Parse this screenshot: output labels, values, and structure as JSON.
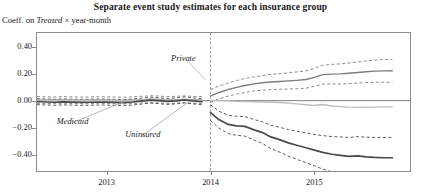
{
  "title": "Separate event study estimates for each insurance group",
  "subtitle": {
    "prefix": "Coeff. on ",
    "emphasis": "Treated",
    "suffix": " × year-month"
  },
  "series_labels": {
    "private": "Private",
    "medicaid": "Medicaid",
    "uninsured": "Uninsured"
  },
  "colors": {
    "private": "#7d7d7d",
    "medicaid": "#bdbdbd",
    "uninsured": "#4a4a4a",
    "frame": "#8c8c8c",
    "zero_line": "#6f6f6f",
    "event_line": "#8c8c8c"
  },
  "chart_data": {
    "type": "line",
    "title": "Separate event study estimates for each insurance group",
    "subtitle": "Coeff. on Treated × year-month",
    "xlabel": "",
    "ylabel": "Coeff. on Treated × year-month",
    "ylim": [
      -0.52,
      0.5
    ],
    "xlim": [
      2012.33,
      2015.92
    ],
    "yticks": [
      0.4,
      0.2,
      0.0,
      -0.2,
      -0.4
    ],
    "ytick_labels": [
      "0.40",
      "0.20",
      "0.00",
      "−0.20",
      "−0.40"
    ],
    "xticks": [
      2013.0,
      2014.0,
      2015.0
    ],
    "xtick_labels": [
      "2013",
      "2014",
      "2015"
    ],
    "grid": false,
    "legend": "inline-annotations",
    "zero_line": 0.0,
    "event_line": {
      "x": 2014.0,
      "style": "dashed",
      "label": ""
    },
    "ci_style": "dashed",
    "ci_level": "95%",
    "series": [
      {
        "name": "Private",
        "color": "#7d7d7d",
        "x": [
          2012.33,
          2012.42,
          2012.5,
          2012.58,
          2012.67,
          2012.75,
          2012.83,
          2012.92,
          2013.0,
          2013.08,
          2013.17,
          2013.25,
          2013.33,
          2013.42,
          2013.5,
          2013.58,
          2013.67,
          2013.75,
          2013.83,
          2013.92,
          2014.0,
          2014.08,
          2014.17,
          2014.25,
          2014.33,
          2014.42,
          2014.5,
          2014.58,
          2014.67,
          2014.75,
          2014.83,
          2014.92,
          2015.0,
          2015.08,
          2015.17,
          2015.25,
          2015.33,
          2015.42,
          2015.5,
          2015.58,
          2015.67,
          2015.75
        ],
        "values": [
          0.005,
          0.004,
          0.003,
          0.006,
          0.004,
          0.002,
          0.003,
          0.005,
          0.004,
          0.002,
          0.001,
          0.003,
          0.006,
          0.01,
          0.008,
          0.004,
          0.006,
          0.009,
          0.006,
          0.003,
          0.035,
          0.06,
          0.082,
          0.098,
          0.112,
          0.124,
          0.132,
          0.138,
          0.142,
          0.146,
          0.15,
          0.156,
          0.172,
          0.192,
          0.196,
          0.198,
          0.202,
          0.208,
          0.214,
          0.218,
          0.22,
          0.221
        ],
        "ci_upper": [
          0.03,
          0.028,
          0.027,
          0.03,
          0.028,
          0.026,
          0.027,
          0.029,
          0.028,
          0.026,
          0.025,
          0.028,
          0.032,
          0.036,
          0.034,
          0.03,
          0.032,
          0.035,
          0.032,
          0.029,
          0.082,
          0.108,
          0.13,
          0.148,
          0.164,
          0.176,
          0.186,
          0.194,
          0.2,
          0.206,
          0.212,
          0.22,
          0.238,
          0.262,
          0.268,
          0.272,
          0.278,
          0.286,
          0.294,
          0.3,
          0.304,
          0.306
        ],
        "ci_lower": [
          -0.02,
          -0.021,
          -0.022,
          -0.019,
          -0.021,
          -0.023,
          -0.022,
          -0.02,
          -0.021,
          -0.023,
          -0.024,
          -0.021,
          -0.018,
          -0.015,
          -0.017,
          -0.021,
          -0.019,
          -0.016,
          -0.019,
          -0.022,
          -0.012,
          0.012,
          0.034,
          0.048,
          0.06,
          0.072,
          0.078,
          0.082,
          0.084,
          0.086,
          0.088,
          0.092,
          0.106,
          0.122,
          0.124,
          0.124,
          0.126,
          0.13,
          0.134,
          0.136,
          0.136,
          0.136
        ]
      },
      {
        "name": "Medicaid",
        "color": "#bdbdbd",
        "x": [
          2012.33,
          2012.42,
          2012.5,
          2012.58,
          2012.67,
          2012.75,
          2012.83,
          2012.92,
          2013.0,
          2013.08,
          2013.17,
          2013.25,
          2013.33,
          2013.42,
          2013.5,
          2013.58,
          2013.67,
          2013.75,
          2013.83,
          2013.92,
          2014.0,
          2014.08,
          2014.17,
          2014.25,
          2014.33,
          2014.42,
          2014.5,
          2014.58,
          2014.67,
          2014.75,
          2014.83,
          2014.92,
          2015.0,
          2015.08,
          2015.17,
          2015.25,
          2015.33,
          2015.42,
          2015.5,
          2015.58,
          2015.67,
          2015.75
        ],
        "values": [
          0.004,
          0.003,
          0.002,
          0.004,
          0.003,
          0.001,
          0.002,
          0.004,
          0.003,
          0.001,
          0.0,
          0.002,
          0.005,
          0.008,
          0.006,
          0.003,
          0.005,
          0.007,
          0.005,
          0.002,
          0.002,
          0.0,
          -0.002,
          -0.004,
          -0.006,
          -0.008,
          -0.01,
          -0.012,
          -0.014,
          -0.018,
          -0.024,
          -0.03,
          -0.036,
          -0.028,
          -0.04,
          -0.044,
          -0.048,
          -0.05,
          -0.05,
          -0.048,
          -0.046,
          -0.046
        ],
        "ci_upper": null,
        "ci_lower": null
      },
      {
        "name": "Uninsured",
        "color": "#4a4a4a",
        "x": [
          2012.33,
          2012.42,
          2012.5,
          2012.58,
          2012.67,
          2012.75,
          2012.83,
          2012.92,
          2013.0,
          2013.08,
          2013.17,
          2013.25,
          2013.33,
          2013.42,
          2013.5,
          2013.58,
          2013.67,
          2013.75,
          2013.83,
          2013.92,
          2014.0,
          2014.08,
          2014.17,
          2014.25,
          2014.33,
          2014.42,
          2014.5,
          2014.58,
          2014.67,
          2014.75,
          2014.83,
          2014.92,
          2015.0,
          2015.08,
          2015.17,
          2015.25,
          2015.33,
          2015.42,
          2015.5,
          2015.58,
          2015.67,
          2015.75
        ],
        "values": [
          -0.008,
          -0.01,
          -0.012,
          -0.009,
          -0.011,
          -0.013,
          -0.012,
          -0.01,
          -0.011,
          -0.013,
          -0.014,
          -0.01,
          -0.004,
          0.004,
          0.0,
          -0.006,
          -0.002,
          0.006,
          -0.002,
          -0.008,
          -0.088,
          -0.14,
          -0.176,
          -0.186,
          -0.19,
          -0.216,
          -0.236,
          -0.268,
          -0.29,
          -0.312,
          -0.33,
          -0.348,
          -0.366,
          -0.382,
          -0.396,
          -0.404,
          -0.412,
          -0.408,
          -0.416,
          -0.42,
          -0.422,
          -0.422
        ],
        "ci_upper": [
          0.014,
          0.012,
          0.01,
          0.013,
          0.011,
          0.009,
          0.01,
          0.012,
          0.011,
          0.009,
          0.008,
          0.012,
          0.018,
          0.026,
          0.022,
          0.016,
          0.02,
          0.028,
          0.02,
          0.014,
          -0.03,
          -0.078,
          -0.108,
          -0.116,
          -0.118,
          -0.14,
          -0.156,
          -0.182,
          -0.198,
          -0.214,
          -0.226,
          -0.238,
          -0.25,
          -0.258,
          -0.266,
          -0.268,
          -0.272,
          -0.266,
          -0.27,
          -0.272,
          -0.272,
          -0.272
        ],
        "ci_lower": [
          -0.03,
          -0.032,
          -0.034,
          -0.031,
          -0.033,
          -0.035,
          -0.034,
          -0.032,
          -0.033,
          -0.035,
          -0.036,
          -0.032,
          -0.026,
          -0.018,
          -0.022,
          -0.028,
          -0.024,
          -0.016,
          -0.024,
          -0.03,
          -0.146,
          -0.202,
          -0.244,
          -0.256,
          -0.262,
          -0.292,
          -0.316,
          -0.354,
          -0.382,
          -0.41,
          -0.434,
          -0.458,
          -0.482,
          -0.506,
          -0.526,
          -0.54,
          -0.552,
          -0.55,
          -0.562,
          -0.568,
          -0.572,
          -0.572
        ]
      }
    ],
    "annotations": [
      {
        "text": "Private",
        "x": 2013.62,
        "y": 0.305,
        "leader_to_x": 2013.95,
        "leader_to_y": 0.155
      },
      {
        "text": "Medicaid",
        "x": 2012.52,
        "y": -0.155,
        "leader_to_x": 2013.22,
        "leader_to_y": 0.01
      },
      {
        "text": "Uninsured",
        "x": 2013.18,
        "y": -0.255,
        "leader_to_x": 2013.78,
        "leader_to_y": -0.015
      }
    ]
  }
}
